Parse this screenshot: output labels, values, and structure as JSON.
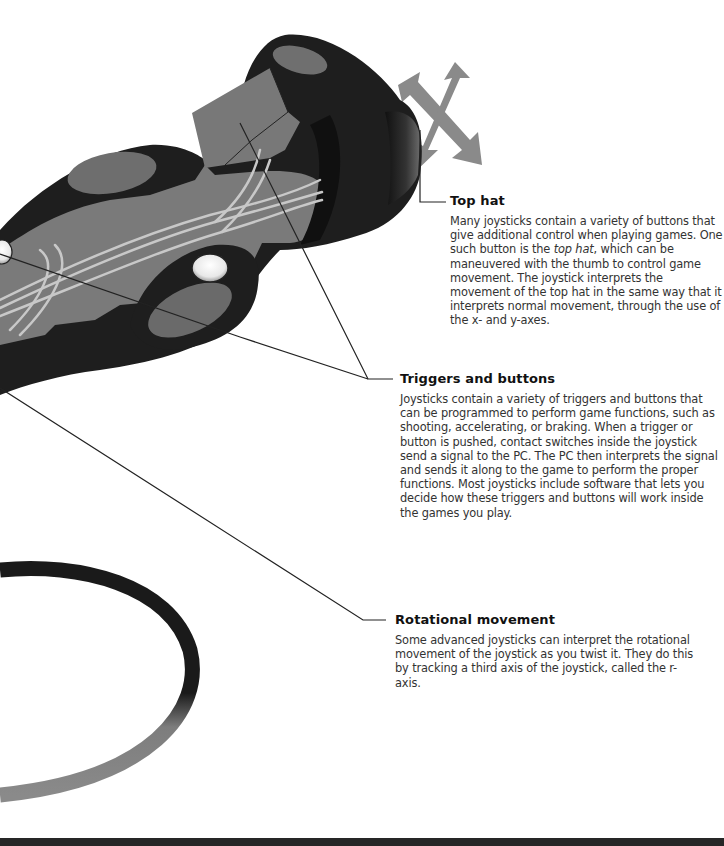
{
  "callouts": {
    "top_hat": {
      "title": "Top hat",
      "body_pre": "Many joysticks contain a variety of buttons that give additional control when playing games. One such button is the ",
      "body_em": "top hat",
      "body_post": ", which can be maneuvered with the thumb to control game movement. The joystick interprets the movement of the top hat in the same way that it interprets normal movement, through the use of the x- and y-axes."
    },
    "triggers": {
      "title": "Triggers and buttons",
      "body": "Joysticks contain a variety of triggers and buttons that can be programmed to perform game functions, such as shooting, accelerating, or braking. When a trigger or button is pushed, contact switches inside the joystick send a signal to the PC. The PC then interprets the signal and sends it along to the game to perform the proper functions. Most joysticks include software that lets you decide how these triggers and buttons will work inside the games you play."
    },
    "rotational": {
      "title": "Rotational movement",
      "body": "Some advanced joysticks can interpret the rotational movement of the joystick as you twist it. They do this by tracking a third axis of the joystick, called the r-axis."
    }
  },
  "illustration": {
    "subject": "joystick-cutaway",
    "colors": {
      "body_dark": "#1e1e1e",
      "body_mid": "#7a7a7a",
      "wires": "#c8c8c8",
      "arrows": "#8a8a8a",
      "leader_lines": "#222222"
    }
  }
}
